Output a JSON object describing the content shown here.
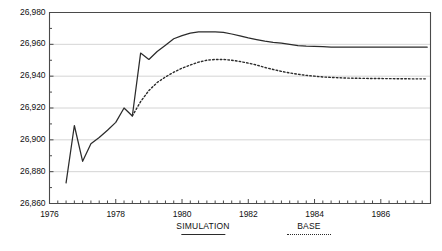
{
  "chart_data": {
    "type": "line",
    "title": "",
    "xlabel": "",
    "ylabel": "",
    "grid": true,
    "legend_position": "bottom",
    "xlim": [
      1976.0,
      1987.5
    ],
    "ylim": [
      26860,
      26980
    ],
    "yticks": [
      "26,860",
      "26,880",
      "26,900",
      "26,920",
      "26,940",
      "26,960",
      "26,980"
    ],
    "ytick_values": [
      26860,
      26880,
      26900,
      26920,
      26940,
      26960,
      26980
    ],
    "xticks": [
      "1976",
      "1978",
      "1980",
      "1982",
      "1984",
      "1986"
    ],
    "xtick_values": [
      1976,
      1978,
      1980,
      1982,
      1984,
      1986
    ],
    "x_minor_interval": 0.25,
    "series": [
      {
        "name": "SIMULATION",
        "style": "solid",
        "color": "#2b2b2b",
        "x": [
          1976.5,
          1976.75,
          1977.0,
          1977.25,
          1977.5,
          1977.75,
          1978.0,
          1978.25,
          1978.5,
          1978.75,
          1979.0,
          1979.25,
          1979.5,
          1979.75,
          1980.0,
          1980.25,
          1980.5,
          1980.75,
          1981.0,
          1981.25,
          1981.5,
          1981.75,
          1982.0,
          1982.25,
          1982.5,
          1982.75,
          1983.0,
          1983.25,
          1983.5,
          1983.75,
          1984.0,
          1984.25,
          1984.5,
          1984.75,
          1985.0,
          1985.5,
          1986.0,
          1986.5,
          1987.0,
          1987.4
        ],
        "y": [
          26873.0,
          26909.0,
          26886.5,
          26897.5,
          26901.5,
          26906.0,
          26911.0,
          26920.0,
          26915.0,
          26954.5,
          26950.5,
          26955.5,
          26959.5,
          26963.5,
          26965.5,
          26967.0,
          26967.8,
          26967.8,
          26967.8,
          26967.5,
          26966.5,
          26965.3,
          26964.0,
          26963.0,
          26962.0,
          26961.3,
          26960.8,
          26960.0,
          26959.2,
          26958.8,
          26958.7,
          26958.5,
          26958.2,
          26958.2,
          26958.2,
          26958.2,
          26958.2,
          26958.2,
          26958.2,
          26958.2
        ]
      },
      {
        "name": "BASE",
        "style": "dotted",
        "color": "#2b2b2b",
        "x": [
          1978.5,
          1978.75,
          1979.0,
          1979.25,
          1979.5,
          1979.75,
          1980.0,
          1980.25,
          1980.5,
          1980.75,
          1981.0,
          1981.25,
          1981.5,
          1981.75,
          1982.0,
          1982.25,
          1982.5,
          1982.75,
          1983.0,
          1983.25,
          1983.5,
          1983.75,
          1984.0,
          1984.25,
          1984.5,
          1984.75,
          1985.0,
          1985.5,
          1986.0,
          1986.5,
          1987.0,
          1987.4
        ],
        "y": [
          26915.0,
          26924.0,
          26931.0,
          26936.0,
          26939.5,
          26942.5,
          26945.0,
          26947.0,
          26948.8,
          26950.0,
          26950.5,
          26950.5,
          26950.0,
          26949.2,
          26948.2,
          26947.0,
          26945.5,
          26944.2,
          26943.0,
          26942.0,
          26941.2,
          26940.5,
          26940.0,
          26939.5,
          26939.2,
          26939.0,
          26938.8,
          26938.6,
          26938.5,
          26938.4,
          26938.3,
          26938.3
        ]
      }
    ],
    "legend": [
      {
        "label": "SIMULATION",
        "style": "solid"
      },
      {
        "label": "BASE",
        "style": "dotted"
      }
    ]
  },
  "style": {
    "axis_color": "#4a4a4a",
    "grid_color": "#c9c9c9",
    "line_color": "#2b2b2b",
    "background": "#ffffff",
    "text_color": "#111111"
  }
}
